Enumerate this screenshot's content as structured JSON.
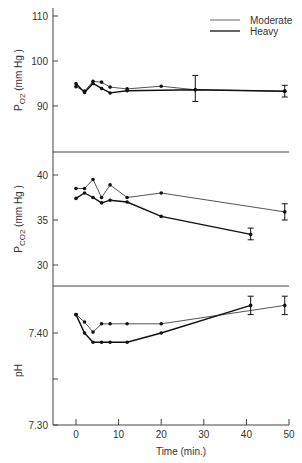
{
  "chart_data": [
    {
      "type": "line",
      "panel": "PO2",
      "ylabel": "PO2 (mm Hg)",
      "ylabel_main": "P",
      "ylabel_sub": "O2",
      "ylabel_unit": " (mm Hg )",
      "ylim": [
        80,
        110
      ],
      "yticks": [
        90,
        100,
        110
      ],
      "xlim": [
        0,
        50
      ],
      "series": [
        {
          "name": "Moderate",
          "x": [
            0,
            2,
            4,
            6,
            8,
            12,
            20,
            28,
            49
          ],
          "values": [
            94.3,
            93.3,
            95.5,
            95.3,
            94.2,
            93.8,
            94.4,
            93.6,
            93.3
          ]
        },
        {
          "name": "Heavy",
          "x": [
            0,
            2,
            4,
            6,
            8,
            12,
            28,
            49
          ],
          "values": [
            95.0,
            93.0,
            95.0,
            93.9,
            92.9,
            93.4,
            93.6,
            93.3
          ]
        }
      ],
      "error_bars": [
        {
          "x": 28,
          "y": 93.6,
          "low": 91.0,
          "high": 96.8
        },
        {
          "x": 49,
          "y": 93.3,
          "low": 92.0,
          "high": 94.6
        }
      ]
    },
    {
      "type": "line",
      "panel": "PCO2",
      "ylabel": "PCO2 (mm Hg)",
      "ylabel_main": "P",
      "ylabel_sub": "CO2",
      "ylabel_unit": " (mm Hg )",
      "ylim": [
        27.5,
        42.5
      ],
      "yticks": [
        30,
        35,
        40
      ],
      "xlim": [
        0,
        50
      ],
      "series": [
        {
          "name": "Moderate",
          "x": [
            0,
            2,
            4,
            6,
            8,
            12,
            20,
            49
          ],
          "values": [
            38.5,
            38.5,
            39.5,
            37.5,
            38.9,
            37.5,
            38.0,
            35.9
          ]
        },
        {
          "name": "Heavy",
          "x": [
            0,
            2,
            4,
            6,
            8,
            12,
            20,
            41
          ],
          "values": [
            37.4,
            38.0,
            37.5,
            36.9,
            37.2,
            37.0,
            35.4,
            33.4
          ]
        }
      ],
      "error_bars": [
        {
          "x": 41,
          "y": 33.4,
          "low": 32.8,
          "high": 34.1
        },
        {
          "x": 49,
          "y": 35.9,
          "low": 35.0,
          "high": 36.8
        }
      ]
    },
    {
      "type": "line",
      "panel": "pH",
      "ylabel": "pH",
      "ylim": [
        7.3,
        7.455
      ],
      "yticks": [
        7.3,
        7.35,
        7.4
      ],
      "ytick_labels": [
        "7.30",
        "",
        "7.40"
      ],
      "xlim": [
        0,
        50
      ],
      "xticks": [
        0,
        10,
        20,
        30,
        40,
        50
      ],
      "xlabel": "Time (min.)",
      "series": [
        {
          "name": "Moderate",
          "x": [
            0,
            2,
            4,
            6,
            8,
            12,
            20,
            49
          ],
          "values": [
            7.42,
            7.412,
            7.401,
            7.41,
            7.41,
            7.41,
            7.41,
            7.43
          ]
        },
        {
          "name": "Heavy",
          "x": [
            0,
            2,
            4,
            6,
            8,
            12,
            20,
            41
          ],
          "values": [
            7.42,
            7.4,
            7.39,
            7.39,
            7.39,
            7.39,
            7.4,
            7.43
          ]
        }
      ],
      "error_bars": [
        {
          "x": 41,
          "y": 7.43,
          "low": 7.42,
          "high": 7.44
        },
        {
          "x": 49,
          "y": 7.43,
          "low": 7.42,
          "high": 7.44
        }
      ]
    }
  ],
  "legend": {
    "entries": [
      {
        "label": "Moderate",
        "style": "thin"
      },
      {
        "label": "Heavy",
        "style": "thick"
      }
    ],
    "position": "top-right"
  },
  "x_axis": {
    "label": "Time (min.)",
    "ticks": [
      "0",
      "10",
      "20",
      "30",
      "40",
      "50"
    ]
  }
}
